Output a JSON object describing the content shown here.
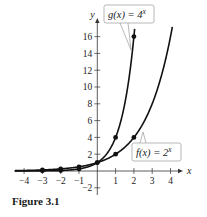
{
  "chart_data": {
    "type": "line",
    "title": "",
    "xlabel": "x",
    "ylabel": "y",
    "xlim": [
      -4.4,
      4.6
    ],
    "ylim": [
      -2.5,
      17.5
    ],
    "x_ticks": [
      -4,
      -3,
      -2,
      -1,
      1,
      2,
      3,
      4
    ],
    "y_ticks": [
      -2,
      2,
      4,
      6,
      8,
      10,
      12,
      14,
      16
    ],
    "grid": false,
    "series": [
      {
        "name": "g(x) = 4^x",
        "label_base": "g(x) = 4",
        "label_exp": "x",
        "base": 4,
        "points": [
          [
            -3,
            0.015625
          ],
          [
            -2,
            0.0625
          ],
          [
            -1,
            0.25
          ],
          [
            0,
            1
          ],
          [
            1,
            4
          ],
          [
            2,
            16
          ]
        ]
      },
      {
        "name": "f(x) = 2^x",
        "label_base": "f(x) = 2",
        "label_exp": "x",
        "base": 2,
        "points": [
          [
            -3,
            0.125
          ],
          [
            -2,
            0.25
          ],
          [
            -1,
            0.5
          ],
          [
            0,
            1
          ],
          [
            1,
            2
          ],
          [
            2,
            4
          ]
        ]
      }
    ],
    "annotations": [
      "g(x) = 4^x",
      "f(x) = 2^x"
    ]
  },
  "caption": "Figure 3.1",
  "colors": {
    "curve": "#111111",
    "axis": "#333333",
    "callout_border": "#9a9a9a"
  }
}
